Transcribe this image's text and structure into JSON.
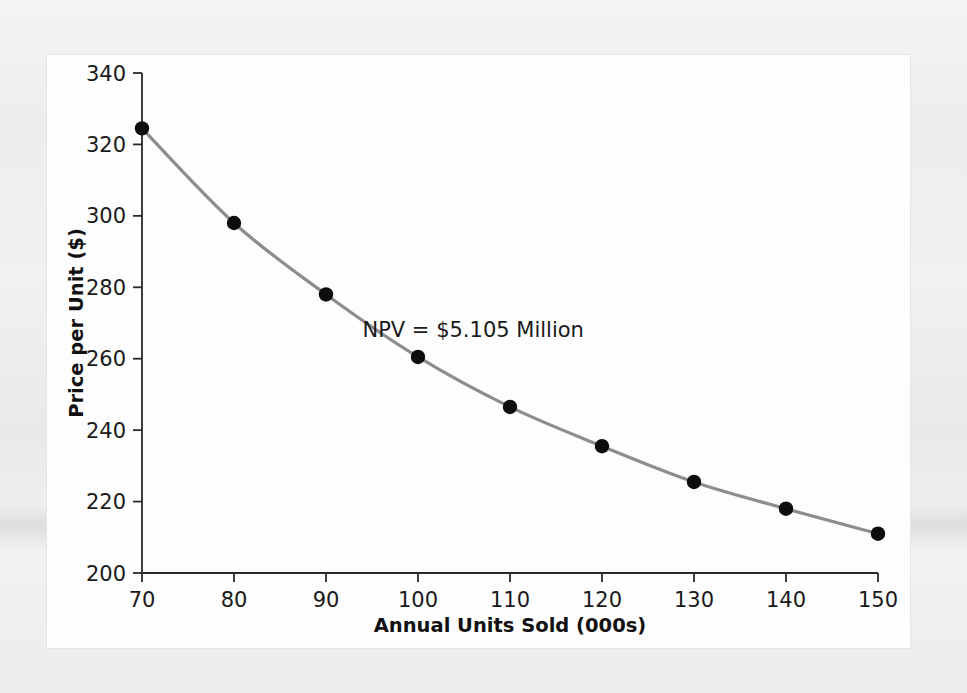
{
  "figure": {
    "background_color": "#efefef",
    "panel_color": "#fdfdfd"
  },
  "chart_data": {
    "type": "line",
    "title": "",
    "xlabel": "Annual Units Sold (000s)",
    "ylabel": "Price per Unit ($)",
    "x": [
      70,
      80,
      90,
      100,
      110,
      120,
      130,
      140,
      150
    ],
    "values": [
      324.5,
      298.0,
      278.0,
      260.5,
      246.5,
      235.5,
      225.5,
      218.0,
      211.0
    ],
    "series": [
      {
        "name": "NPV = $5.105 Million",
        "values": [
          324.5,
          298.0,
          278.0,
          260.5,
          246.5,
          235.5,
          225.5,
          218.0,
          211.0
        ]
      }
    ],
    "xlim": [
      70,
      150
    ],
    "ylim": [
      200,
      340
    ],
    "xticks": [
      70,
      80,
      90,
      100,
      110,
      120,
      130,
      140,
      150
    ],
    "xticklabels": [
      "70",
      "80",
      "90",
      "100",
      "110",
      "120",
      "130",
      "140",
      "150"
    ],
    "yticks": [
      200,
      220,
      240,
      260,
      280,
      300,
      320,
      340
    ],
    "yticklabels": [
      "200",
      "220",
      "240",
      "260",
      "280",
      "300",
      "320",
      "340"
    ],
    "grid": false,
    "legend": "none",
    "line_color": "#8d8d8d",
    "marker_color": "#0d0d0d",
    "annotations": [
      {
        "text": "NPV = $5.105 Million",
        "x": 106,
        "y": 266
      }
    ]
  }
}
